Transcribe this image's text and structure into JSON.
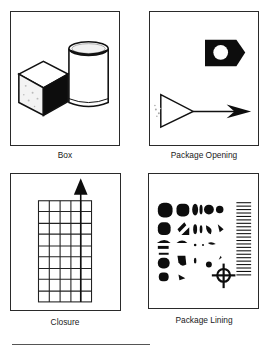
{
  "figure": {
    "panels": [
      {
        "id": "box",
        "caption": "Box",
        "icon": "box-and-cylinder-icon"
      },
      {
        "id": "package-opening",
        "caption": "Package Opening",
        "icon": "nut-and-arrow-icon"
      },
      {
        "id": "closure",
        "caption": "Closure",
        "icon": "grid-with-arrow-icon"
      },
      {
        "id": "package-lining",
        "caption": "Package Lining",
        "icon": "halftone-dots-target-icon"
      }
    ],
    "colors": {
      "ink": "#111111",
      "frame": "#2a2a2a",
      "background": "#ffffff"
    }
  }
}
